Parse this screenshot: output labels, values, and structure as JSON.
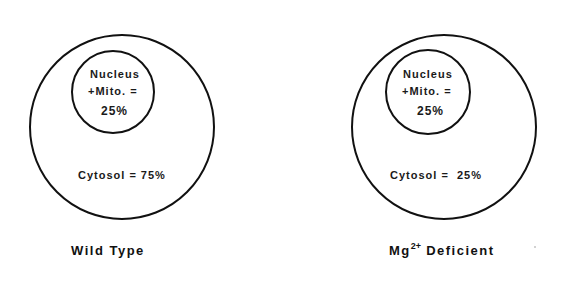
{
  "panels": [
    {
      "title": "Wild Type",
      "inner": {
        "line1": "Nucleus",
        "line2": "+Mito. =",
        "value": "25%"
      },
      "outer": {
        "label": "Cytosol = 75%"
      }
    },
    {
      "title_main": "Mg",
      "title_sup": "2+",
      "title_rest": " Deficient",
      "inner": {
        "line1": "Nucleus",
        "line2": "+Mito. =",
        "value": "25%"
      },
      "outer": {
        "label": "Cytosol =  25%"
      }
    }
  ],
  "colors": {
    "stroke": "#111111",
    "background": "#ffffff"
  }
}
